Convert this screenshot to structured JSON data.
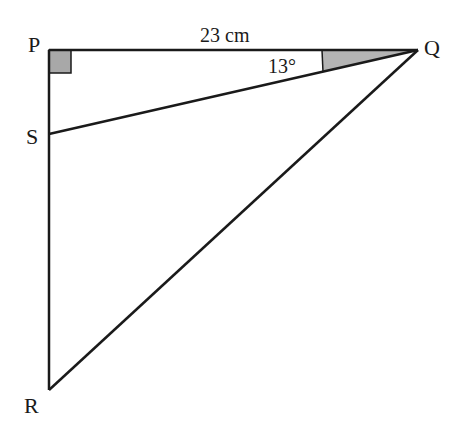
{
  "diagram": {
    "type": "geometry-triangle",
    "vertices": {
      "P": {
        "label": "P",
        "x": 49,
        "y": 50
      },
      "Q": {
        "label": "Q",
        "x": 418,
        "y": 50
      },
      "S": {
        "label": "S",
        "x": 49,
        "y": 134
      },
      "R": {
        "label": "R",
        "x": 49,
        "y": 390
      }
    },
    "segments": [
      "PQ",
      "PR",
      "QR",
      "QS"
    ],
    "right_angle_at": "P",
    "length_label": "23 cm",
    "angle_label": "13°",
    "angle_at": "Q",
    "angle_between": [
      "PQ",
      "QS"
    ],
    "colors": {
      "stroke": "#1a1a1a",
      "shade": "#a8a8a8"
    }
  }
}
